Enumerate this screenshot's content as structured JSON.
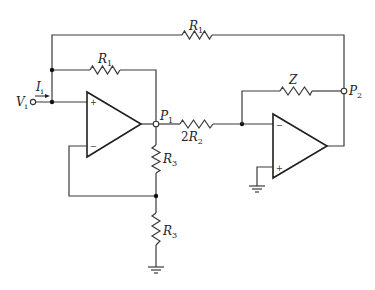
{
  "diagram": {
    "type": "circuit-schematic",
    "components": {
      "r1_outer": {
        "label": "R",
        "sub": "1"
      },
      "r1_inner": {
        "label": "R",
        "sub": "1"
      },
      "r2": {
        "prefix": "2",
        "label": "R",
        "sub": "2"
      },
      "z": {
        "label": "Z"
      },
      "r3_upper": {
        "label": "R",
        "sub": "3"
      },
      "r3_lower": {
        "label": "R",
        "sub": "3"
      }
    },
    "nodes": {
      "vi": {
        "label": "V",
        "sub": "i"
      },
      "ii": {
        "label": "I",
        "sub": "i"
      },
      "p1": {
        "label": "P",
        "sub": "1"
      },
      "p2": {
        "label": "P",
        "sub": "2"
      }
    },
    "opamps": {
      "a1": {
        "plus": "+",
        "minus": "−"
      },
      "a2": {
        "plus": "+",
        "minus": "−"
      }
    }
  }
}
